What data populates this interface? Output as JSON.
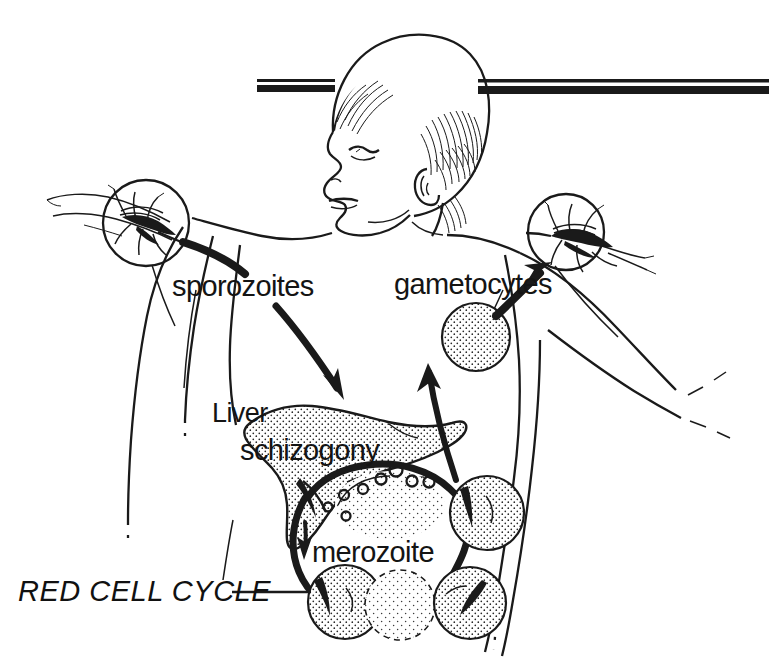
{
  "figure": {
    "background_color": "#ffffff",
    "ink_color": "#1a1a1a",
    "width": 769,
    "height": 664
  },
  "labels": {
    "sporozoites": "sporozoites",
    "gametocytes": "gametocytes",
    "liver": "Liver",
    "schizogony": "schizogony",
    "merozoite": "merozoite",
    "red_cell_cycle": "RED CELL CYCLE"
  },
  "elements": {
    "human_figure": "human-torso-and-head",
    "left_vector": "mosquito-biting-left-arm",
    "right_vector": "mosquito-biting-right-arm",
    "organ": "liver",
    "horizontal_rule": "double-rule-bar",
    "leader_line": "red-cell-cycle-leader-line"
  },
  "arrows": [
    {
      "name": "sporozoite-injection-arrow",
      "from": "left-mosquito",
      "to": "liver"
    },
    {
      "name": "merozoite-release-arrow",
      "from": "liver",
      "to": "red-cell-cycle"
    },
    {
      "name": "red-cell-cycle-arrow",
      "from": "infected-red-cell",
      "to": "infected-red-cell"
    },
    {
      "name": "gametocyte-uptake-arrow",
      "from": "gametocyte",
      "to": "right-mosquito"
    }
  ],
  "cells": {
    "gametocyte": "gametocyte-cell",
    "infected_red_cells": [
      "ring-stage-cell-1",
      "ring-stage-cell-2",
      "ring-stage-cell-3",
      "ring-stage-cell-4"
    ],
    "uninfected_red_cell": "uninfected-red-cell",
    "free_merozoites_count": 7
  }
}
